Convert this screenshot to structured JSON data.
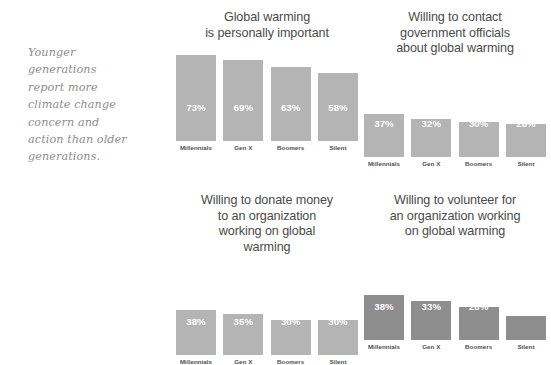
{
  "caption": {
    "lines": [
      "Younger",
      "generations",
      "report more",
      "climate change",
      "concern and",
      "action than older",
      "generations."
    ]
  },
  "colors": {
    "bar_light": "#b4b4b4",
    "bar_dark": "#8e8e8e",
    "title_text": "#4a4a4a",
    "caption_text": "#8d8d8d",
    "value_text": "#ffffff",
    "category_text": "#4f4f4f",
    "background": "#ffffff"
  },
  "chart_data": [
    {
      "id": "chart-1",
      "type": "bar",
      "title": "Global warming is personally important",
      "title_lines": [
        "Global warming",
        "is personally important"
      ],
      "categories": [
        "Millennials",
        "Gen X",
        "Boomers",
        "Silent"
      ],
      "values": [
        73,
        69,
        63,
        58
      ],
      "value_labels": [
        "73%",
        "69%",
        "63%",
        "58%"
      ],
      "xlabel": "",
      "ylabel": "",
      "ylim": [
        0,
        100
      ],
      "grid": false,
      "legend": "none",
      "bar_color": "#b4b4b4"
    },
    {
      "id": "chart-2",
      "type": "bar",
      "title": "Willing to contact government officials about global warming",
      "title_lines": [
        "Willing to contact",
        "government officials",
        "about global warming"
      ],
      "categories": [
        "Millennials",
        "Gen X",
        "Boomers",
        "Silent"
      ],
      "values": [
        37,
        32,
        30,
        28
      ],
      "value_labels": [
        "37%",
        "32%",
        "30%",
        "28%"
      ],
      "xlabel": "",
      "ylabel": "",
      "ylim": [
        0,
        100
      ],
      "grid": false,
      "legend": "none",
      "bar_color": "#b4b4b4"
    },
    {
      "id": "chart-3",
      "type": "bar",
      "title": "Willing to donate money to an organization working on global warming",
      "title_lines": [
        "Willing to donate money",
        "to an organization",
        "working on global",
        "warming"
      ],
      "categories": [
        "Millennials",
        "Gen X",
        "Boomers",
        "Silent"
      ],
      "values": [
        38,
        35,
        30,
        30
      ],
      "value_labels": [
        "38%",
        "35%",
        "30%",
        "30%"
      ],
      "xlabel": "",
      "ylabel": "",
      "ylim": [
        0,
        100
      ],
      "grid": false,
      "legend": "none",
      "bar_color": "#b4b4b4"
    },
    {
      "id": "chart-4",
      "type": "bar",
      "title": "Willing to volunteer for an organization working on global warming",
      "title_lines": [
        "Willing to volunteer for",
        "an organization working",
        "on global warming"
      ],
      "categories": [
        "Millennials",
        "Gen X",
        "Boomers",
        "Silent"
      ],
      "values": [
        38,
        33,
        28,
        20
      ],
      "value_labels": [
        "38%",
        "33%",
        "28%",
        "20%"
      ],
      "xlabel": "",
      "ylabel": "",
      "ylim": [
        0,
        100
      ],
      "grid": false,
      "legend": "none",
      "bar_color": "#8e8e8e"
    }
  ]
}
